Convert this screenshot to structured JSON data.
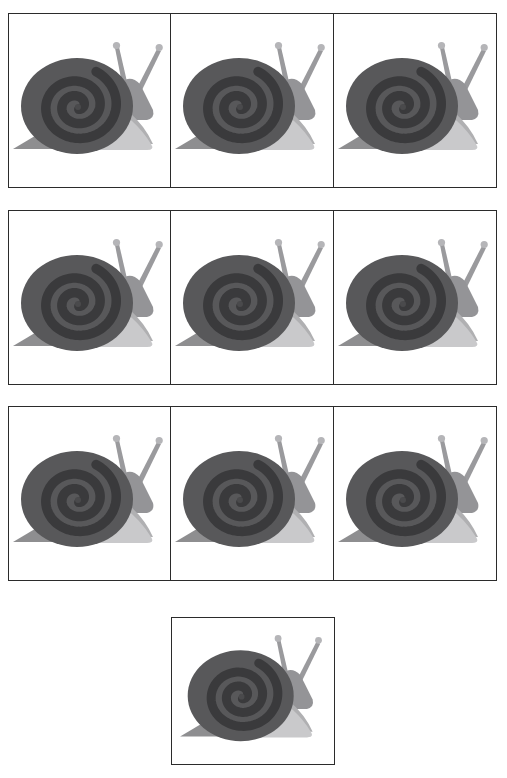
{
  "page": {
    "background_color": "#ffffff",
    "width": 507,
    "height": 778,
    "cell_border_color": "#2b2b2b"
  },
  "artwork": {
    "subject": "snail",
    "style": "flat grayscale clipart",
    "icon_name": "snail-icon",
    "colors": {
      "shell_base": "#58585a",
      "shell_spiral_band": "#3a3a3c",
      "shell_inner_core": "#4a4a4c",
      "head_neck": "#949497",
      "body_upper": "#b0b0b2",
      "body_lower": "#c9c9cb",
      "foot_shadow": "#8e8e90",
      "antenna": "#9a9a9d",
      "antenna_tip": "#b5b5b8"
    }
  },
  "grid": {
    "rows": [
      {
        "row_label": "row-1",
        "cells": [
          {
            "cell_label": "cell-1-1",
            "content": "snail"
          },
          {
            "cell_label": "cell-1-2",
            "content": "snail"
          },
          {
            "cell_label": "cell-1-3",
            "content": "snail"
          }
        ]
      },
      {
        "row_label": "row-2",
        "cells": [
          {
            "cell_label": "cell-2-1",
            "content": "snail"
          },
          {
            "cell_label": "cell-2-2",
            "content": "snail"
          },
          {
            "cell_label": "cell-2-3",
            "content": "snail"
          }
        ]
      },
      {
        "row_label": "row-3",
        "cells": [
          {
            "cell_label": "cell-3-1",
            "content": "snail"
          },
          {
            "cell_label": "cell-3-2",
            "content": "snail"
          },
          {
            "cell_label": "cell-3-3",
            "content": "snail"
          }
        ]
      },
      {
        "row_label": "row-4",
        "cells": [
          {
            "cell_label": "cell-4-1",
            "content": "snail"
          }
        ]
      }
    ],
    "total_cells": 10
  }
}
